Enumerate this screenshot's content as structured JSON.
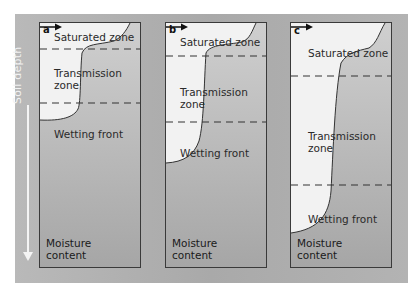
{
  "figure": {
    "y_axis_label": "Soil depth",
    "x_axis_label_line1": "Moisture",
    "x_axis_label_line2": "content",
    "colors": {
      "frame": "#aeaeae",
      "panel_border": "#3a3a3a",
      "wet_region": "#f2f2f2",
      "dry_region": "#a9a9a9",
      "dash_line": "#333333",
      "axis_arrow": "#f4f4f4"
    }
  },
  "panels": [
    {
      "id": "a",
      "label": "a",
      "zones": {
        "saturated": "Saturated zone",
        "transmission_line1": "Transmission",
        "transmission_line2": "zone",
        "wetting_front": "Wetting front"
      },
      "moisture_line1": "Moisture",
      "moisture_line2": "content"
    },
    {
      "id": "b",
      "label": "b",
      "zones": {
        "saturated": "Saturated zone",
        "transmission_line1": "Transmission",
        "transmission_line2": "zone",
        "wetting_front": "Wetting front"
      },
      "moisture_line1": "Moisture",
      "moisture_line2": "content"
    },
    {
      "id": "c",
      "label": "c",
      "zones": {
        "saturated": "Saturated zone",
        "transmission_line1": "Transmission",
        "transmission_line2": "zone",
        "wetting_front": "Wetting front"
      },
      "moisture_line1": "Moisture",
      "moisture_line2": "content"
    }
  ]
}
